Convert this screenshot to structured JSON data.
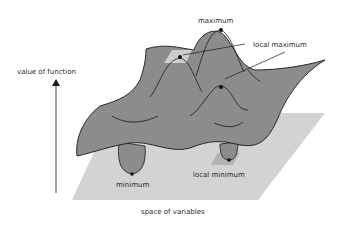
{
  "diagram": {
    "labels": {
      "y_axis": "value of function",
      "x_plane": "space of variables",
      "maximum": "maximum",
      "local_maximum": "local maximum",
      "minimum": "minimum",
      "local_minimum": "local minimum"
    },
    "colors": {
      "surface": "#8c8c8c",
      "plane": "#d3d3d3",
      "highlight": "#c8c8c8",
      "stroke": "#1a1a1a",
      "text": "#2a2a2a",
      "background": "#ffffff"
    }
  }
}
